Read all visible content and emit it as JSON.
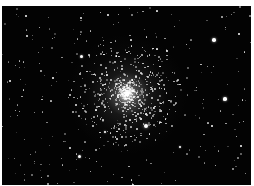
{
  "image": {
    "subject": "Globular star cluster against black sky",
    "background_color": "#030303",
    "border_color": "#ffffff",
    "core": {
      "x": 125,
      "y": 88,
      "color": "#ffffff"
    }
  },
  "bright_stars": [
    {
      "x": 144,
      "y": 120,
      "r": 2.2
    },
    {
      "x": 212,
      "y": 34,
      "r": 1.8
    },
    {
      "x": 223,
      "y": 93,
      "r": 1.7
    },
    {
      "x": 79,
      "y": 50,
      "r": 1.5
    },
    {
      "x": 77,
      "y": 150,
      "r": 1.5
    },
    {
      "x": 103,
      "y": 126,
      "r": 1.3
    },
    {
      "x": 178,
      "y": 141,
      "r": 1.3
    },
    {
      "x": 106,
      "y": 9,
      "r": 1.1
    },
    {
      "x": 24,
      "y": 10,
      "r": 1.1
    },
    {
      "x": 237,
      "y": 28,
      "r": 1.1
    },
    {
      "x": 8,
      "y": 75,
      "r": 1.0
    },
    {
      "x": 51,
      "y": 72,
      "r": 1.0
    },
    {
      "x": 210,
      "y": 120,
      "r": 1.1
    },
    {
      "x": 239,
      "y": 140,
      "r": 1.0
    },
    {
      "x": 165,
      "y": 45,
      "r": 1.0
    }
  ]
}
